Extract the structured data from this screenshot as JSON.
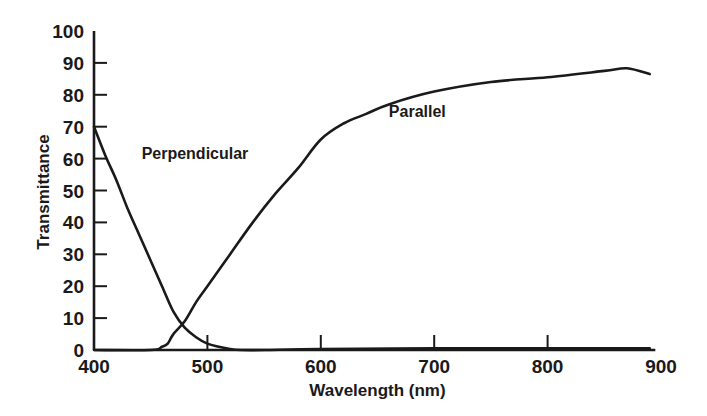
{
  "chart_data": {
    "type": "line",
    "title": "",
    "xlabel": "Wavelength (nm)",
    "ylabel": "Transmittance",
    "xlim": [
      400,
      900
    ],
    "ylim": [
      0,
      100
    ],
    "grid": false,
    "legend": "inline labels",
    "x_ticks": [
      400,
      500,
      600,
      700,
      800,
      900
    ],
    "y_ticks": [
      0,
      10,
      20,
      30,
      40,
      50,
      60,
      70,
      80,
      90,
      100
    ],
    "series": [
      {
        "name": "Perpendicular",
        "label_pos": [
          442,
          60
        ],
        "x": [
          400,
          410,
          420,
          430,
          440,
          450,
          460,
          470,
          480,
          490,
          500,
          510,
          520,
          530,
          550,
          600,
          700,
          800,
          890
        ],
        "values": [
          70,
          61,
          53,
          44,
          36,
          28,
          20,
          12,
          7,
          4,
          2,
          1,
          0.3,
          0,
          0,
          0.3,
          0.5,
          0.5,
          0.5
        ]
      },
      {
        "name": "Parallel",
        "label_pos": [
          660,
          73
        ],
        "x": [
          400,
          450,
          460,
          465,
          470,
          480,
          490,
          500,
          520,
          540,
          560,
          580,
          600,
          620,
          640,
          660,
          700,
          750,
          800,
          850,
          870,
          890
        ],
        "values": [
          0,
          0,
          1,
          2,
          5,
          9,
          15,
          20,
          30,
          40,
          49,
          57,
          66,
          71,
          74,
          77,
          81,
          84,
          85.5,
          87.5,
          88.3,
          86.5
        ]
      }
    ]
  }
}
